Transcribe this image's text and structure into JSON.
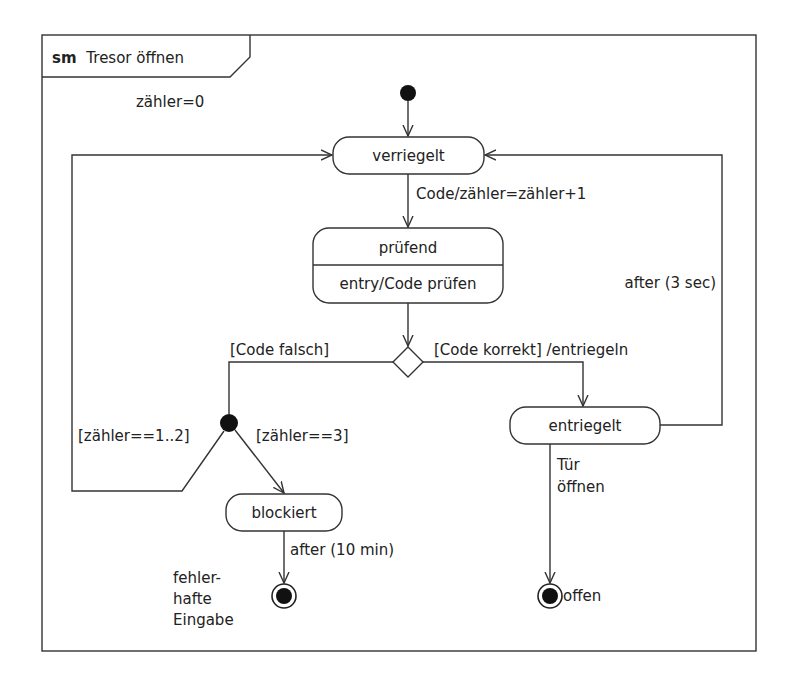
{
  "frame": {
    "keyword": "sm",
    "title": "Tresor öffnen"
  },
  "initial": {
    "label": "zähler=0"
  },
  "states": {
    "verriegelt": {
      "name": "verriegelt"
    },
    "pruefend": {
      "name": "prüfend",
      "internal": "entry/Code prüfen"
    },
    "entriegelt": {
      "name": "entriegelt"
    },
    "blockiert": {
      "name": "blockiert"
    }
  },
  "transitions": {
    "verriegelt_to_pruefend": "Code/zähler=zähler+1",
    "guard_false": "[Code falsch]",
    "guard_true": "[Code korrekt] /entriegeln",
    "guard_retry": "[zähler==1..2]",
    "guard_block": "[zähler==3]",
    "entriegelt_timeout": "after (3 sec)",
    "blockiert_timeout": "after (10 min)",
    "open_door_line1": "Tür",
    "open_door_line2": "öffnen"
  },
  "finals": {
    "error": {
      "line1": "fehler-",
      "line2": "hafte",
      "line3": "Eingabe"
    },
    "open": {
      "label": "offen"
    }
  }
}
